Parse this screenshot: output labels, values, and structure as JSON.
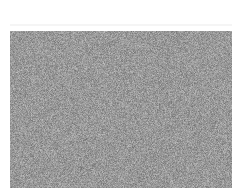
{
  "image": {
    "description": "Uniform grayscale random noise rectangle on white background",
    "noise": {
      "base_color": "#999999",
      "min_gray": 110,
      "max_gray": 195,
      "seed": 1337
    },
    "background_color": "#ffffff"
  }
}
